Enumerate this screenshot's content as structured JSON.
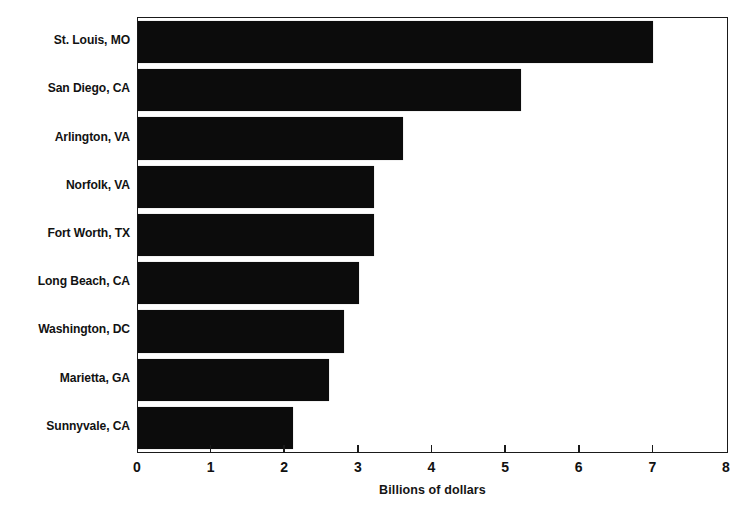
{
  "chart_data": {
    "type": "bar",
    "orientation": "horizontal",
    "title": "",
    "categories": [
      "St. Louis, MO",
      "San Diego, CA",
      "Arlington, VA",
      "Norfolk, VA",
      "Fort Worth, TX",
      "Long Beach, CA",
      "Washington, DC",
      "Marietta, GA",
      "Sunnyvale, CA"
    ],
    "values": [
      7.0,
      5.2,
      3.6,
      3.2,
      3.2,
      3.0,
      2.8,
      2.6,
      2.1
    ],
    "xlabel": "Billions of dollars",
    "ylabel": "",
    "xlim": [
      0,
      8
    ],
    "xticks": [
      0,
      1,
      2,
      3,
      4,
      5,
      6,
      7,
      8
    ],
    "xtick_labels": [
      "0",
      "1",
      "2",
      "3",
      "4",
      "5",
      "6",
      "7",
      "8"
    ],
    "grid": false,
    "legend": null,
    "bar_color": "#0c0c0c",
    "frame_color": "#1a1a1a",
    "background": "#ffffff"
  },
  "axis": {
    "x_title": "Billions of dollars"
  }
}
